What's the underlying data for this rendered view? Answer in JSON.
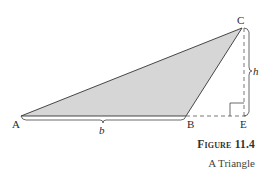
{
  "figure": {
    "number": "Figure 11.4",
    "caption": "A Triangle"
  },
  "vertices": {
    "A": "A",
    "B": "B",
    "C": "C",
    "E": "E"
  },
  "measures": {
    "base": "b",
    "height": "h"
  },
  "colors": {
    "fill": "#d6d6d6",
    "stroke": "#333333"
  }
}
